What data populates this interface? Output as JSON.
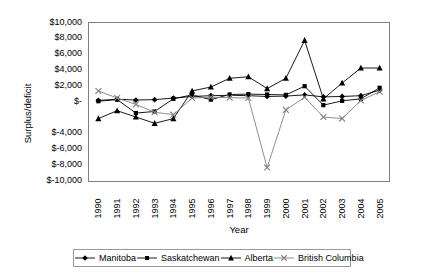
{
  "chart_data": {
    "type": "line",
    "title": "",
    "xlabel": "Year",
    "ylabel": "Surplus/deficit",
    "grid": false,
    "legend_position": "bottom",
    "categories": [
      1990,
      1991,
      1992,
      1993,
      1994,
      1995,
      1996,
      1997,
      1998,
      1999,
      2000,
      2001,
      2002,
      2003,
      2004,
      2005
    ],
    "x_tick_labels": [
      "1990",
      "1991",
      "1992",
      "1993",
      "1994",
      "1995",
      "1996",
      "1997",
      "1998",
      "1999",
      "2000",
      "2001",
      "2002",
      "2003",
      "2004",
      "2005"
    ],
    "ylim": [
      -10000,
      10000
    ],
    "y_tick_values": [
      10000,
      8000,
      6000,
      4000,
      2000,
      0,
      -4000,
      -6000,
      -8000,
      -10000
    ],
    "y_tick_labels": [
      "$10,000",
      "$8,000",
      "$6,000",
      "$4,000",
      "$2,000",
      "$-",
      "$-4,000",
      "$-6,000",
      "$-8,000",
      "$-10,000"
    ],
    "series": [
      {
        "name": "Manitoba",
        "marker": "diamond",
        "color": "#000000",
        "values": [
          200,
          350,
          250,
          300,
          500,
          700,
          800,
          850,
          800,
          700,
          750,
          900,
          650,
          700,
          800,
          1500
        ]
      },
      {
        "name": "Saskatchewan",
        "marker": "square",
        "color": "#000000",
        "values": [
          100,
          300,
          -1400,
          -1200,
          400,
          900,
          300,
          950,
          1000,
          950,
          900,
          2000,
          -400,
          150,
          400,
          1800
        ]
      },
      {
        "name": "Alberta",
        "marker": "triangle",
        "color": "#000000",
        "values": [
          -2100,
          -1100,
          -1900,
          -2700,
          -2100,
          1400,
          1900,
          3000,
          3200,
          1700,
          3000,
          7800,
          400,
          2400,
          4300,
          4300
        ]
      },
      {
        "name": "British Columbia",
        "marker": "cross",
        "color": "#808080",
        "values": [
          1400,
          500,
          -300,
          -1300,
          -1600,
          500,
          600,
          550,
          500,
          -8300,
          -1000,
          600,
          -1900,
          -2100,
          200,
          1300
        ]
      }
    ]
  },
  "legend": {
    "items": [
      {
        "label": "Manitoba"
      },
      {
        "label": "Saskatchewan"
      },
      {
        "label": "Alberta"
      },
      {
        "label": "British Columbia"
      }
    ]
  }
}
